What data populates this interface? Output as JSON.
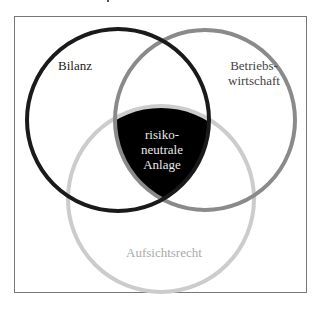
{
  "diagram": {
    "type": "venn",
    "sets": [
      {
        "id": "bilanz",
        "label": "Bilanz",
        "stroke": "#1a1a1a"
      },
      {
        "id": "betriebswirtschaft",
        "label_line1": "Betriebs-",
        "label_line2": "wirtschaft",
        "stroke": "#8a8a8a"
      },
      {
        "id": "aufsichtsrecht",
        "label": "Aufsichtsrecht",
        "stroke": "#cccccc"
      }
    ],
    "intersection": {
      "line1": "risiko-",
      "line2": "neutrale",
      "line3": "Anlage",
      "fill": "#000000"
    }
  }
}
